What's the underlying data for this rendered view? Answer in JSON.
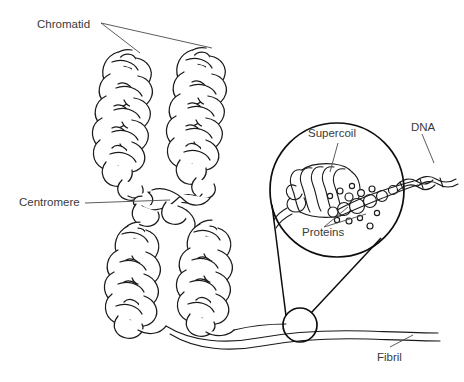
{
  "figure": {
    "background_color": "#ffffff",
    "ink_color": "#1a1a1a",
    "label_color": "#3a3a3a"
  },
  "labels": {
    "chromatid": "Chromatid",
    "centromere": "Centromere",
    "supercoil": "Supercoil",
    "proteins": "Proteins",
    "dna": "DNA",
    "fibril": "Fibril"
  },
  "parts": {
    "chromatid_arms": 4,
    "magnifier_shape": "circle",
    "supercoil_turns": 5,
    "protein_beads": 17
  }
}
